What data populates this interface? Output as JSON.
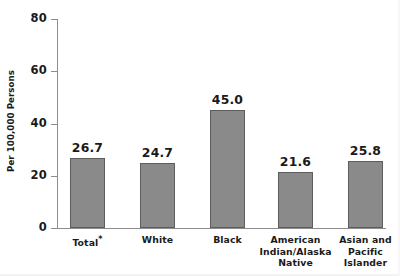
{
  "chart_data": {
    "type": "bar",
    "title": "",
    "subtitle": "",
    "xlabel": "",
    "ylabel": "Per 100,000 Persons",
    "ylim": [
      0,
      80
    ],
    "yticks": [
      "0",
      "20",
      "40",
      "60",
      "80"
    ],
    "ytick_values": [
      0,
      20,
      40,
      60,
      80
    ],
    "grid": false,
    "legend": false,
    "legend_position": "none",
    "categories": [
      "Total*",
      "White",
      "Black",
      "American Indian/Alaska Native",
      "Asian and Pacific Islander"
    ],
    "category_lines": [
      [
        "Total*"
      ],
      [
        "White"
      ],
      [
        "Black"
      ],
      [
        "American",
        "Indian/Alaska",
        "Native"
      ],
      [
        "Asian and",
        "Pacific",
        "Islander"
      ]
    ],
    "values": [
      26.7,
      24.7,
      45.0,
      21.6,
      25.8
    ],
    "value_labels": [
      "26.7",
      "24.7",
      "45.0",
      "21.6",
      "25.8"
    ],
    "bar_color": "#8a8a8a",
    "bar_edge_color": "#5d5d5d",
    "axis_color": "#8d8d8d",
    "text_color": "#1a1a1a",
    "background_color": "#ffffff",
    "footnote_marker": "*"
  }
}
